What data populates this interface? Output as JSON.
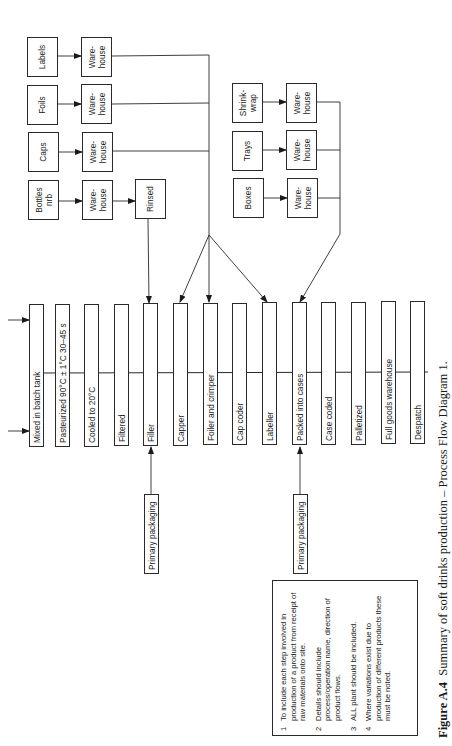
{
  "figure": {
    "number": "Figure A.4",
    "title": "Summary of soft drinks production – Process Flow Diagram 1."
  },
  "process_steps": [
    {
      "label": "Mixed in batch tank"
    },
    {
      "label": "Pasteurized 90°C ± 1°C 30–45 s"
    },
    {
      "label": "Cooled to 20°C"
    },
    {
      "label": "Filtered"
    },
    {
      "label": "Filler"
    },
    {
      "label": "Capper"
    },
    {
      "label": "Foiler and crimper"
    },
    {
      "label": "Cap coder"
    },
    {
      "label": "Labeller"
    },
    {
      "label": "Packed into cases"
    },
    {
      "label": "Case coded"
    },
    {
      "label": "Palletized"
    },
    {
      "label": "Full goods warehouse"
    },
    {
      "label": "Despatch"
    }
  ],
  "materials_left": [
    {
      "label": "Labels",
      "store": "Ware-\nhouse"
    },
    {
      "label": "Foils",
      "store": "Ware-\nhouse"
    },
    {
      "label": "Caps",
      "store": "Ware-\nhouse"
    },
    {
      "label": "Bottles\nnrb",
      "store": "Ware-\nhouse",
      "extra": "Rinsed"
    }
  ],
  "materials_right": [
    {
      "label": "Shrink-\nwrap",
      "store": "Ware-\nhouse"
    },
    {
      "label": "Trays",
      "store": "Ware-\nhouse"
    },
    {
      "label": "Boxes",
      "store": "Ware-\nhouse"
    }
  ],
  "side_inputs": [
    {
      "label": "Primary packaging",
      "target": "Filler"
    },
    {
      "label": "Primary packaging",
      "target": "Packed into cases"
    }
  ],
  "notes": [
    {
      "num": "1",
      "text": "To include each step involved in production of a product from receipt of raw materials onto site."
    },
    {
      "num": "2",
      "text": "Details should include process/operation name, direction of product flows."
    },
    {
      "num": "3",
      "text": "ALL plant should be included."
    },
    {
      "num": "4",
      "text": "Where variations exist due to production of different products these must be noted."
    }
  ]
}
